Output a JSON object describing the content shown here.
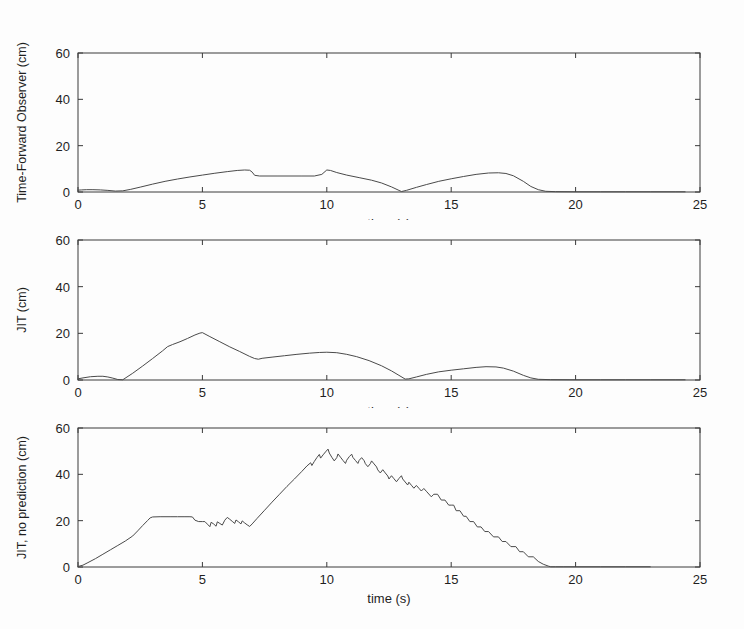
{
  "figure": {
    "background": "#fdfdfd",
    "line_color": "#4a4a4a",
    "axis_color": "#3a3a3a",
    "panel_count": 3
  },
  "chart_data": [
    {
      "type": "line",
      "title": "",
      "xlabel": "time (s)",
      "ylabel": "Time-Forward Observer (cm)",
      "xlim": [
        0,
        25
      ],
      "ylim": [
        0,
        60
      ],
      "xticks": [
        0,
        5,
        10,
        15,
        20,
        25
      ],
      "yticks": [
        0,
        20,
        40,
        60
      ],
      "xticklabels": [
        "0",
        "5",
        "10",
        "15",
        "20",
        "25"
      ],
      "yticklabels": [
        "0",
        "20",
        "40",
        "60"
      ],
      "grid": false,
      "legend": "none",
      "series": [
        {
          "name": "Time-Forward Observer",
          "x": [
            0.0,
            0.15,
            0.35,
            0.6,
            0.9,
            1.2,
            1.5,
            1.8,
            2.1,
            2.5,
            3.0,
            3.5,
            4.0,
            4.5,
            5.0,
            5.5,
            6.0,
            6.4,
            6.7,
            6.9,
            7.0,
            7.1,
            7.3,
            8.0,
            9.0,
            9.5,
            9.8,
            10.0,
            10.15,
            10.4,
            10.8,
            11.3,
            11.8,
            12.2,
            12.6,
            12.9,
            13.0,
            13.2,
            13.6,
            14.0,
            14.5,
            15.0,
            15.5,
            16.0,
            16.5,
            16.9,
            17.2,
            17.5,
            17.9,
            18.2,
            18.5,
            18.8,
            19.2,
            20.0,
            21.0,
            22.0,
            23.0,
            24.0,
            24.4
          ],
          "y": [
            0.8,
            0.9,
            1.0,
            1.0,
            0.9,
            0.7,
            0.4,
            0.5,
            1.1,
            2.1,
            3.4,
            4.6,
            5.6,
            6.5,
            7.3,
            8.1,
            8.8,
            9.3,
            9.5,
            9.4,
            8.6,
            7.2,
            6.9,
            6.9,
            6.9,
            6.9,
            7.6,
            9.5,
            9.3,
            8.4,
            7.3,
            6.2,
            5.1,
            3.9,
            2.2,
            0.7,
            0.2,
            0.7,
            2.0,
            3.2,
            4.6,
            5.7,
            6.7,
            7.6,
            8.2,
            8.3,
            8.0,
            7.0,
            4.6,
            2.4,
            1.0,
            0.3,
            0.15,
            0.1,
            0.1,
            0.1,
            0.1,
            0.1,
            0.1
          ]
        }
      ]
    },
    {
      "type": "line",
      "title": "",
      "xlabel": "time (s)",
      "ylabel": "JIT (cm)",
      "xlim": [
        0,
        25
      ],
      "ylim": [
        0,
        60
      ],
      "xticks": [
        0,
        5,
        10,
        15,
        20,
        25
      ],
      "yticks": [
        0,
        20,
        40,
        60
      ],
      "xticklabels": [
        "0",
        "5",
        "10",
        "15",
        "20",
        "25"
      ],
      "yticklabels": [
        "0",
        "20",
        "40",
        "60"
      ],
      "grid": false,
      "legend": "none",
      "series": [
        {
          "name": "JIT",
          "x": [
            0.0,
            0.2,
            0.5,
            0.8,
            1.0,
            1.2,
            1.4,
            1.6,
            1.8,
            2.2,
            2.6,
            3.0,
            3.4,
            3.6,
            3.8,
            4.1,
            4.4,
            4.7,
            4.9,
            5.0,
            5.3,
            5.7,
            6.1,
            6.5,
            6.9,
            7.1,
            7.25,
            7.4,
            7.8,
            8.3,
            8.8,
            9.3,
            9.7,
            10.0,
            10.4,
            10.8,
            11.2,
            11.7,
            12.2,
            12.6,
            12.9,
            13.15,
            13.3,
            13.6,
            14.0,
            14.5,
            15.0,
            15.5,
            16.0,
            16.4,
            16.8,
            17.1,
            17.5,
            17.9,
            18.2,
            18.5,
            19.0,
            20.0,
            21.0,
            22.0,
            23.0,
            24.0,
            24.4
          ],
          "y": [
            0.5,
            0.9,
            1.4,
            1.6,
            1.6,
            1.3,
            0.8,
            0.2,
            0.1,
            2.9,
            6.0,
            9.2,
            12.5,
            14.3,
            15.2,
            16.4,
            17.8,
            19.3,
            20.1,
            20.3,
            18.6,
            16.4,
            14.2,
            12.2,
            10.1,
            9.2,
            8.9,
            9.3,
            9.8,
            10.4,
            11.0,
            11.5,
            11.8,
            11.9,
            11.7,
            11.0,
            10.0,
            8.3,
            6.1,
            3.9,
            2.0,
            0.4,
            0.5,
            1.3,
            2.4,
            3.5,
            4.2,
            4.8,
            5.4,
            5.7,
            5.6,
            5.1,
            3.8,
            2.0,
            0.9,
            0.3,
            0.15,
            0.1,
            0.1,
            0.1,
            0.1,
            0.1,
            0.1
          ]
        }
      ]
    },
    {
      "type": "line",
      "title": "",
      "xlabel": "time (s)",
      "ylabel": "JIT, no prediction (cm)",
      "xlim": [
        0,
        25
      ],
      "ylim": [
        0,
        60
      ],
      "xticks": [
        0,
        5,
        10,
        15,
        20,
        25
      ],
      "yticks": [
        0,
        20,
        40,
        60
      ],
      "xticklabels": [
        "0",
        "5",
        "10",
        "15",
        "20",
        "25"
      ],
      "yticklabels": [
        "0",
        "20",
        "40",
        "60"
      ],
      "grid": false,
      "legend": "none",
      "series": [
        {
          "name": "JIT, no prediction",
          "x": [
            0.0,
            0.2,
            0.4,
            0.7,
            1.0,
            1.3,
            1.6,
            1.9,
            2.2,
            2.4,
            2.6,
            2.8,
            2.9,
            3.0,
            3.3,
            3.7,
            4.0,
            4.3,
            4.5,
            4.6,
            4.7,
            4.85,
            5.0,
            5.1,
            5.2,
            5.3,
            5.35,
            5.45,
            5.55,
            5.6,
            5.7,
            5.8,
            5.9,
            6.0,
            6.1,
            6.2,
            6.3,
            6.35,
            6.45,
            6.55,
            6.6,
            6.7,
            6.8,
            6.9,
            7.0,
            7.2,
            7.5,
            7.8,
            8.1,
            8.4,
            8.7,
            9.0,
            9.2,
            9.35,
            9.4,
            9.5,
            9.6,
            9.7,
            9.75,
            9.85,
            9.95,
            10.05,
            10.1,
            10.2,
            10.3,
            10.4,
            10.45,
            10.55,
            10.65,
            10.75,
            10.8,
            10.9,
            11.0,
            11.05,
            11.15,
            11.25,
            11.3,
            11.4,
            11.5,
            11.55,
            11.65,
            11.75,
            11.8,
            11.9,
            12.0,
            12.05,
            12.15,
            12.25,
            12.35,
            12.45,
            12.5,
            12.6,
            12.7,
            12.8,
            12.9,
            13.0,
            13.05,
            13.15,
            13.25,
            13.3,
            13.4,
            13.5,
            13.6,
            13.7,
            13.8,
            13.9,
            14.0,
            14.1,
            14.2,
            14.3,
            14.45,
            14.6,
            14.75,
            14.9,
            15.0,
            15.1,
            15.2,
            15.35,
            15.5,
            15.6,
            15.75,
            15.9,
            16.05,
            16.2,
            16.35,
            16.5,
            16.7,
            16.9,
            17.05,
            17.2,
            17.4,
            17.6,
            17.75,
            17.9,
            18.1,
            18.3,
            18.5,
            18.7,
            18.9,
            19.0,
            19.2,
            19.5,
            20.0,
            21.0,
            22.0,
            23.0,
            24.0,
            24.4
          ],
          "y": [
            0.2,
            0.8,
            1.9,
            3.6,
            5.5,
            7.4,
            9.3,
            11.2,
            13.4,
            15.6,
            17.9,
            20.1,
            21.2,
            21.6,
            21.7,
            21.7,
            21.7,
            21.7,
            21.7,
            21.6,
            20.2,
            19.6,
            19.6,
            19.6,
            18.5,
            17.4,
            19.3,
            18.6,
            17.6,
            19.5,
            18.8,
            18.1,
            20.2,
            21.4,
            20.6,
            19.7,
            18.8,
            20.3,
            19.5,
            18.6,
            19.9,
            19.0,
            18.2,
            17.5,
            18.6,
            21.0,
            24.5,
            28.0,
            31.4,
            34.8,
            38.0,
            41.3,
            43.6,
            45.0,
            43.8,
            45.6,
            47.2,
            48.6,
            47.0,
            48.4,
            49.7,
            50.9,
            49.2,
            47.4,
            45.8,
            47.2,
            48.8,
            47.4,
            46.0,
            44.7,
            46.1,
            47.6,
            48.7,
            47.3,
            46.0,
            44.7,
            46.0,
            47.2,
            45.9,
            44.6,
            43.3,
            44.6,
            45.8,
            44.5,
            43.2,
            41.9,
            40.6,
            42.0,
            40.6,
            39.3,
            38.0,
            39.4,
            38.1,
            36.8,
            38.2,
            39.4,
            38.0,
            36.7,
            35.4,
            36.6,
            35.3,
            34.0,
            35.2,
            34.0,
            32.8,
            33.9,
            32.7,
            31.5,
            30.3,
            31.4,
            31.4,
            28.9,
            28.9,
            26.7,
            26.7,
            26.7,
            24.3,
            24.3,
            21.9,
            21.9,
            19.6,
            19.6,
            17.3,
            17.3,
            15.3,
            15.3,
            13.0,
            13.0,
            11.0,
            11.0,
            8.8,
            8.8,
            6.6,
            6.6,
            4.4,
            4.4,
            2.4,
            1.2,
            0.4,
            0.1,
            0.1,
            0.1,
            0.1,
            0.1,
            0.1,
            0.1
          ]
        }
      ]
    }
  ]
}
